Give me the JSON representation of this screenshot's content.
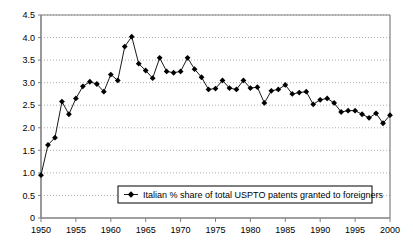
{
  "chart_data": {
    "type": "line",
    "title": "",
    "subtitle": "",
    "xlabel": "",
    "ylabel": "",
    "xlim": [
      1950,
      2000
    ],
    "ylim": [
      0,
      4.5
    ],
    "grid": true,
    "grid_style": "dotted-horizontal",
    "legend_position": "bottom-center-inside",
    "marker": "diamond",
    "series": [
      {
        "name": "Italian % share of total USPTO  patents granted to foreigners",
        "x": [
          1950,
          1951,
          1952,
          1953,
          1954,
          1955,
          1956,
          1957,
          1958,
          1959,
          1960,
          1961,
          1962,
          1963,
          1964,
          1965,
          1966,
          1967,
          1968,
          1969,
          1970,
          1971,
          1972,
          1973,
          1974,
          1975,
          1976,
          1977,
          1978,
          1979,
          1980,
          1981,
          1982,
          1983,
          1984,
          1985,
          1986,
          1987,
          1988,
          1989,
          1990,
          1991,
          1992,
          1993,
          1994,
          1995,
          1996,
          1997,
          1998,
          1999,
          2000
        ],
        "values": [
          0.95,
          1.62,
          1.78,
          2.58,
          2.3,
          2.65,
          2.92,
          3.02,
          2.97,
          2.8,
          3.18,
          3.05,
          3.8,
          4.02,
          3.42,
          3.27,
          3.1,
          3.55,
          3.25,
          3.22,
          3.25,
          3.55,
          3.3,
          3.12,
          2.85,
          2.87,
          3.05,
          2.88,
          2.85,
          3.05,
          2.88,
          2.9,
          2.55,
          2.82,
          2.85,
          2.95,
          2.75,
          2.78,
          2.8,
          2.52,
          2.62,
          2.65,
          2.55,
          2.35,
          2.38,
          2.38,
          2.3,
          2.22,
          2.32,
          2.1,
          2.28
        ]
      }
    ],
    "yticks": [
      0,
      0.5,
      1.0,
      1.5,
      2.0,
      2.5,
      3.0,
      3.5,
      4.0,
      4.5
    ],
    "ytick_labels": [
      "0",
      "0.5",
      "1.0",
      "1.5",
      "2.0",
      "2.5",
      "3.0",
      "3.5",
      "4.0",
      "4.5"
    ],
    "xticks": [
      1950,
      1955,
      1960,
      1965,
      1970,
      1975,
      1980,
      1985,
      1990,
      1995,
      2000
    ],
    "xtick_labels": [
      "1950",
      "1955",
      "1960",
      "1965",
      "1970",
      "1975",
      "1980",
      "1985",
      "1990",
      "1995",
      "2000"
    ],
    "colors": {
      "line": "#000000",
      "marker": "#000000",
      "axis": "#808080",
      "grid": "#999999",
      "background": "#ffffff",
      "legend_border": "#000000"
    }
  },
  "legend": {
    "label": "Italian % share of total USPTO  patents granted to foreigners",
    "marker_name": "diamond-marker"
  }
}
